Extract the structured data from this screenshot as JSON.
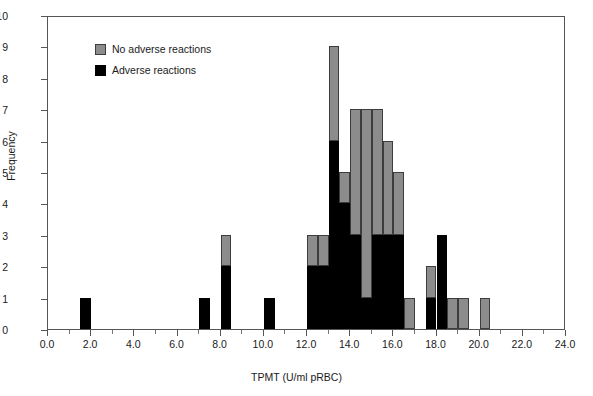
{
  "chart_data": {
    "type": "bar",
    "subtype": "stacked-histogram",
    "title": "",
    "xlabel": "TPMT (U/ml pRBC)",
    "ylabel": "Frequency",
    "xlim": [
      0.0,
      24.0
    ],
    "ylim": [
      0,
      10
    ],
    "xtick_step": 2.0,
    "ytick_step": 1,
    "bin_width": 0.5,
    "grid": false,
    "legend_position": "upper-left-inside",
    "xticks": [
      "0.0",
      "2.0",
      "4.0",
      "6.0",
      "8.0",
      "10.0",
      "12.0",
      "14.0",
      "16.0",
      "18.0",
      "20.0",
      "22.0",
      "24.0"
    ],
    "yticks": [
      "0",
      "1",
      "2",
      "3",
      "4",
      "5",
      "6",
      "7",
      "8",
      "9",
      "10"
    ],
    "series": [
      {
        "name": "Adverse reactions",
        "color": "#000000",
        "bins": [
          {
            "x0": 1.5,
            "value": 1
          },
          {
            "x0": 7.0,
            "value": 1
          },
          {
            "x0": 8.0,
            "value": 2
          },
          {
            "x0": 10.0,
            "value": 1
          },
          {
            "x0": 12.0,
            "value": 2
          },
          {
            "x0": 12.5,
            "value": 2
          },
          {
            "x0": 13.0,
            "value": 6
          },
          {
            "x0": 13.5,
            "value": 4
          },
          {
            "x0": 14.0,
            "value": 3
          },
          {
            "x0": 14.5,
            "value": 1
          },
          {
            "x0": 15.0,
            "value": 3
          },
          {
            "x0": 15.5,
            "value": 3
          },
          {
            "x0": 16.0,
            "value": 3
          },
          {
            "x0": 17.5,
            "value": 1
          },
          {
            "x0": 18.0,
            "value": 3
          }
        ]
      },
      {
        "name": "No adverse reactions",
        "color": "#8c8c8c",
        "bins": [
          {
            "x0": 12.0,
            "value": 1
          },
          {
            "x0": 12.5,
            "value": 1
          },
          {
            "x0": 13.0,
            "value": 3
          },
          {
            "x0": 13.5,
            "value": 1
          },
          {
            "x0": 14.0,
            "value": 4
          },
          {
            "x0": 14.5,
            "value": 6
          },
          {
            "x0": 15.0,
            "value": 4
          },
          {
            "x0": 15.5,
            "value": 3
          },
          {
            "x0": 16.0,
            "value": 2
          },
          {
            "x0": 16.5,
            "value": 1
          },
          {
            "x0": 17.5,
            "value": 1
          },
          {
            "x0": 18.5,
            "value": 1
          },
          {
            "x0": 19.0,
            "value": 1
          },
          {
            "x0": 20.0,
            "value": 1
          }
        ]
      }
    ],
    "totals_by_bin": [
      {
        "x0": 1.5,
        "black": 1,
        "gray": 0,
        "total": 1
      },
      {
        "x0": 7.0,
        "black": 1,
        "gray": 0,
        "total": 1
      },
      {
        "x0": 8.0,
        "black": 2,
        "gray": 1,
        "total": 3
      },
      {
        "x0": 10.0,
        "black": 1,
        "gray": 0,
        "total": 1
      },
      {
        "x0": 12.0,
        "black": 2,
        "gray": 1,
        "total": 3
      },
      {
        "x0": 12.5,
        "black": 2,
        "gray": 1,
        "total": 3
      },
      {
        "x0": 13.0,
        "black": 6,
        "gray": 3,
        "total": 9
      },
      {
        "x0": 13.5,
        "black": 4,
        "gray": 1,
        "total": 5
      },
      {
        "x0": 14.0,
        "black": 3,
        "gray": 4,
        "total": 7
      },
      {
        "x0": 14.5,
        "black": 1,
        "gray": 6,
        "total": 7
      },
      {
        "x0": 15.0,
        "black": 3,
        "gray": 4,
        "total": 7
      },
      {
        "x0": 15.5,
        "black": 3,
        "gray": 3,
        "total": 6
      },
      {
        "x0": 16.0,
        "black": 3,
        "gray": 2,
        "total": 5
      },
      {
        "x0": 16.5,
        "black": 0,
        "gray": 1,
        "total": 1
      },
      {
        "x0": 17.5,
        "black": 1,
        "gray": 1,
        "total": 2
      },
      {
        "x0": 18.0,
        "black": 3,
        "gray": 0,
        "total": 3
      },
      {
        "x0": 18.5,
        "black": 0,
        "gray": 1,
        "total": 1
      },
      {
        "x0": 19.0,
        "black": 0,
        "gray": 1,
        "total": 1
      },
      {
        "x0": 20.0,
        "black": 0,
        "gray": 1,
        "total": 1
      }
    ]
  },
  "legend": {
    "items": [
      {
        "label": "No adverse reactions",
        "swatch": "gray"
      },
      {
        "label": "Adverse reactions",
        "swatch": "black"
      }
    ]
  },
  "axes": {
    "x_title": "TPMT (U/ml pRBC)",
    "y_title": "Frequency"
  },
  "caption": ""
}
